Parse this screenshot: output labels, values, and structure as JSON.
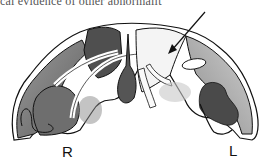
{
  "document": {
    "top_text_fragment": "cal evidence of other abnormalit"
  },
  "figure": {
    "labels": {
      "right": "R",
      "left": "L"
    },
    "arrow": {
      "direction": "down-left",
      "points_to": "pale region on left hemisphere side"
    }
  }
}
